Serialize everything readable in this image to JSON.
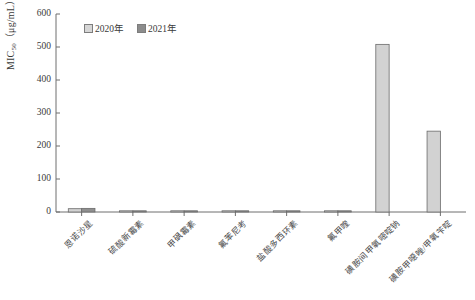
{
  "chart_data": {
    "type": "bar",
    "title": "",
    "xlabel": "",
    "ylabel": "MIC50 (μg/mL)",
    "ylabel_main": "MIC",
    "ylabel_sub": "50",
    "ylabel_unit": "（μg/mL）",
    "ylim": [
      0,
      600
    ],
    "ytick_step": 100,
    "yticks": [
      "600",
      "500",
      "400",
      "300",
      "200",
      "100",
      "0"
    ],
    "grid": false,
    "legend_position": "top-left-inside",
    "categories": [
      "恩诺沙星",
      "硫酸新霉素",
      "甲砜霉素",
      "氟苯尼考",
      "盐酸多西环素",
      "氟甲喹",
      "磺胺间甲氧嘧啶钠",
      "磺胺甲噁唑/甲氧苄啶"
    ],
    "series": [
      {
        "name": "2020年",
        "color": "#d2d2d2",
        "values": [
          10,
          2,
          2,
          2,
          2,
          1,
          508,
          245
        ]
      },
      {
        "name": "2021年",
        "color": "#8f8f8f",
        "values": [
          11,
          2,
          2,
          2,
          2,
          1,
          0,
          0
        ]
      }
    ]
  },
  "legend": {
    "items": [
      {
        "label": "2020年",
        "color": "#d2d2d2"
      },
      {
        "label": "2021年",
        "color": "#8f8f8f"
      }
    ]
  }
}
